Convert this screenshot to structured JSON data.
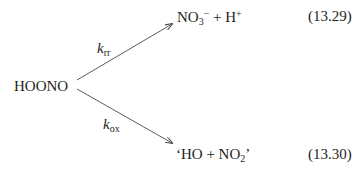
{
  "reactant": {
    "label": "HOONO"
  },
  "upper_branch": {
    "rate_symbol": "k",
    "rate_subscript": "rr",
    "product_main": "NO",
    "product_sub": "3",
    "product_sup": "−",
    "product_rest": " + H",
    "product_rest_sup": "+",
    "equation_number": "(13.29)"
  },
  "lower_branch": {
    "rate_symbol": "k",
    "rate_subscript": "ox",
    "product_main": "‘HO + NO",
    "product_sub": "2",
    "product_tail": "’",
    "equation_number": "(13.30)"
  },
  "colors": {
    "text": "#231f20",
    "arrow": "#4a4a4a",
    "background": "#ffffff"
  }
}
